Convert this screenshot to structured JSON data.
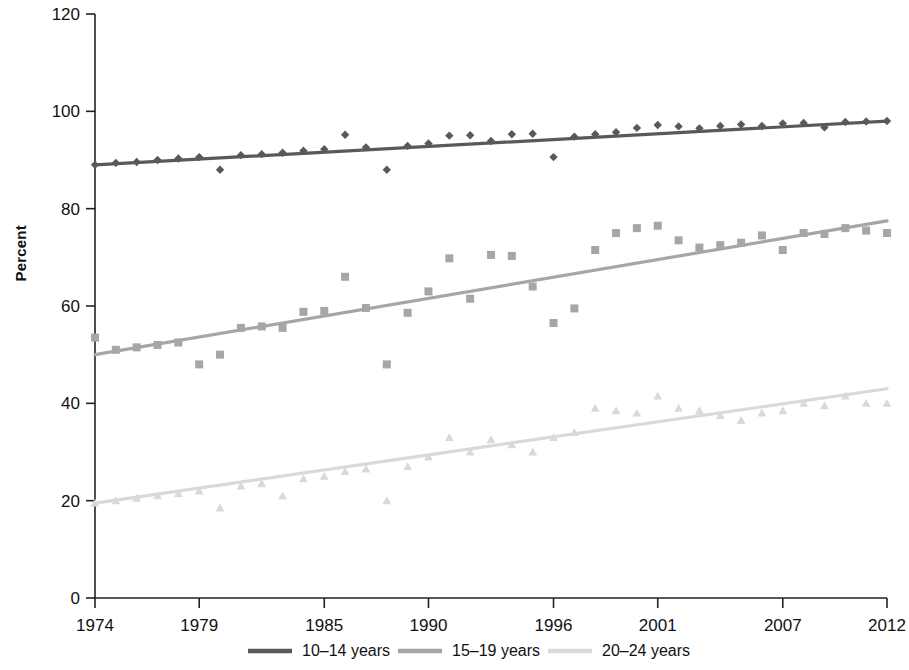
{
  "chart_data": {
    "type": "scatter",
    "title": "",
    "xlabel": "",
    "ylabel": "Percent",
    "xlim": [
      1974,
      2012
    ],
    "ylim": [
      0,
      120
    ],
    "grid": false,
    "legend_position": "bottom",
    "xticks": [
      "1974",
      "1979",
      "1985",
      "1990",
      "1996",
      "2001",
      "2007",
      "2012"
    ],
    "xtick_values": [
      1974,
      1979,
      1985,
      1990,
      1996,
      2001,
      2007,
      2012
    ],
    "yticks": [
      "0",
      "20",
      "40",
      "60",
      "80",
      "100",
      "120"
    ],
    "ytick_values": [
      0,
      20,
      40,
      60,
      80,
      100,
      120
    ],
    "series": [
      {
        "name": "10–14 years",
        "color": "#595959",
        "marker": "diamond",
        "trend": {
          "x0": 1974,
          "y0": 89.0,
          "x1": 2012,
          "y1": 98.0
        },
        "x": [
          1974,
          1975,
          1976,
          1977,
          1978,
          1979,
          1980,
          1981,
          1982,
          1983,
          1984,
          1985,
          1986,
          1987,
          1988,
          1989,
          1990,
          1991,
          1992,
          1993,
          1994,
          1995,
          1996,
          1997,
          1998,
          1999,
          2000,
          2001,
          2002,
          2003,
          2004,
          2005,
          2006,
          2007,
          2008,
          2009,
          2010,
          2011,
          2012
        ],
        "values": [
          89.0,
          89.4,
          89.6,
          90.0,
          90.3,
          90.6,
          88.0,
          91.0,
          91.2,
          91.5,
          91.9,
          92.2,
          95.2,
          92.6,
          88.0,
          92.9,
          93.4,
          95.0,
          95.1,
          93.9,
          95.3,
          95.4,
          90.6,
          94.8,
          95.3,
          95.7,
          96.6,
          97.2,
          96.9,
          96.5,
          97.0,
          97.3,
          97.0,
          97.5,
          97.6,
          96.7,
          97.8,
          97.9,
          98.0
        ]
      },
      {
        "name": "15–19 years",
        "color": "#a6a6a6",
        "marker": "square",
        "trend": {
          "x0": 1974,
          "y0": 50.0,
          "x1": 2012,
          "y1": 77.5
        },
        "x": [
          1974,
          1975,
          1976,
          1977,
          1978,
          1979,
          1980,
          1981,
          1982,
          1983,
          1984,
          1985,
          1986,
          1987,
          1988,
          1989,
          1990,
          1991,
          1992,
          1993,
          1994,
          1995,
          1996,
          1997,
          1998,
          1999,
          2000,
          2001,
          2002,
          2003,
          2004,
          2005,
          2006,
          2007,
          2008,
          2009,
          2010,
          2011,
          2012
        ],
        "values": [
          53.5,
          51.0,
          51.5,
          52.0,
          52.5,
          48.0,
          50.0,
          55.5,
          55.8,
          55.5,
          58.8,
          59.0,
          66.0,
          59.6,
          48.0,
          58.6,
          63.0,
          69.8,
          61.5,
          70.5,
          70.3,
          64.0,
          56.5,
          59.5,
          71.5,
          75.0,
          76.0,
          76.5,
          73.5,
          72.0,
          72.5,
          73.0,
          74.5,
          71.5,
          75.0,
          74.8,
          76.0,
          75.5,
          75.0
        ]
      },
      {
        "name": "20–24 years",
        "color": "#d9d9d9",
        "marker": "triangle",
        "trend": {
          "x0": 1974,
          "y0": 19.5,
          "x1": 2012,
          "y1": 43.0
        },
        "x": [
          1974,
          1975,
          1976,
          1977,
          1978,
          1979,
          1980,
          1981,
          1982,
          1983,
          1984,
          1985,
          1986,
          1987,
          1988,
          1989,
          1990,
          1991,
          1992,
          1993,
          1994,
          1995,
          1996,
          1997,
          1998,
          1999,
          2000,
          2001,
          2002,
          2003,
          2004,
          2005,
          2006,
          2007,
          2008,
          2009,
          2010,
          2011,
          2012
        ],
        "values": [
          19.5,
          20.0,
          20.5,
          21.0,
          21.5,
          22.0,
          18.5,
          23.0,
          23.5,
          21.0,
          24.5,
          25.0,
          26.0,
          26.5,
          20.0,
          27.0,
          29.0,
          33.0,
          30.0,
          32.5,
          31.5,
          30.0,
          33.0,
          34.0,
          39.0,
          38.5,
          38.0,
          41.5,
          39.0,
          38.5,
          37.5,
          36.5,
          38.0,
          38.5,
          40.0,
          39.5,
          41.5,
          40.0,
          40.0
        ]
      }
    ]
  },
  "legend": {
    "items": [
      {
        "label": "10–14 years",
        "color": "#595959"
      },
      {
        "label": "15–19 years",
        "color": "#a6a6a6"
      },
      {
        "label": "20–24 years",
        "color": "#d9d9d9"
      }
    ]
  },
  "axis": {
    "y_title": "Percent"
  }
}
